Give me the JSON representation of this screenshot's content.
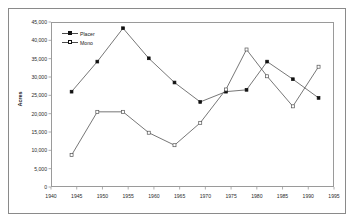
{
  "chart_data": {
    "type": "line",
    "title": "",
    "subtitle": "",
    "xlabel": "",
    "ylabel": "Acres",
    "xlim": [
      1940,
      1995
    ],
    "ylim": [
      0,
      45000
    ],
    "grid": false,
    "legend_position": "top-left inside plot area",
    "x_ticks": [
      "1940",
      "1945",
      "1950",
      "1955",
      "1960",
      "1965",
      "1970",
      "1975",
      "1980",
      "1985",
      "1990",
      "1995"
    ],
    "y_ticks": [
      "0",
      "5,000",
      "10,000",
      "15,000",
      "20,000",
      "25,000",
      "30,000",
      "35,000",
      "40,000",
      "45,000"
    ],
    "series": [
      {
        "name": "Placer",
        "marker": "filled-square",
        "color": "#333333",
        "x": [
          1944,
          1949,
          1954,
          1959,
          1964,
          1969,
          1974,
          1978,
          1982,
          1987,
          1992
        ],
        "values": [
          26000,
          34200,
          43300,
          35100,
          28500,
          23200,
          26000,
          26500,
          34200,
          29400,
          24300
        ]
      },
      {
        "name": "Mono",
        "marker": "open-square",
        "color": "#666666",
        "x": [
          1944,
          1949,
          1954,
          1959,
          1964,
          1969,
          1974,
          1978,
          1982,
          1987,
          1992
        ],
        "values": [
          8700,
          20500,
          20500,
          14800,
          11400,
          17500,
          26600,
          37500,
          30200,
          22000,
          32800
        ]
      }
    ]
  },
  "legend": {
    "items": [
      {
        "label": "Placer"
      },
      {
        "label": "Mono"
      }
    ]
  },
  "axes": {
    "y_title": "Acres"
  },
  "colors": {
    "line": "#4a4a4a",
    "marker_fill": "#111111",
    "frame": "#9a9a9a",
    "outer_frame": "#8a8a8a",
    "text": "#1a1a1a",
    "background": "#ffffff"
  }
}
